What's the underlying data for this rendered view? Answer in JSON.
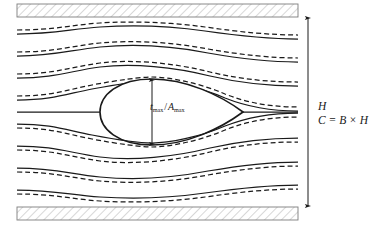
{
  "figure": {
    "kind": "flow-around-streamlined-body-in-channel",
    "background_color": "#ffffff",
    "line_color": "#1a1a1a",
    "wall_hatch_color": "#9a9a9a"
  },
  "labels": {
    "height_symbol": "H",
    "area_relation": "C = B × H",
    "thickness_ratio": {
      "numerator_symbol": "t",
      "numerator_subscript": "max",
      "separator": "/",
      "denominator_symbol": "A",
      "denominator_subscript": "max"
    }
  },
  "channel": {
    "left_x": 17,
    "right_x": 298,
    "top_wall_bottom_y": 17,
    "bottom_wall_top_y": 207,
    "wall_band_thickness": 13,
    "hatch_angle_deg": 45
  },
  "body": {
    "shape": "teardrop-airfoil",
    "leading_edge_x": 100,
    "trailing_edge_x": 243,
    "centerline_y": 112,
    "max_half_thickness": 33,
    "max_thickness_x": 152
  },
  "dimension_arrows": [
    {
      "name": "channel-height-arrow",
      "orientation": "vertical",
      "x": 308,
      "y_top": 17,
      "y_bottom": 207,
      "heads": "both"
    },
    {
      "name": "body-thickness-arrow",
      "orientation": "vertical",
      "x": 152,
      "y_top": 79,
      "y_bottom": 145,
      "heads": "both"
    }
  ],
  "streamlines": {
    "count_each_side": 4,
    "centerline_included": true,
    "solid_style": "solid",
    "dashed_style": "dashed",
    "dash_pattern": "5,3",
    "note": "Each solid streamline is paired with a dashed streamline displaced away from the centerline in the upper half and below it in the lower half"
  }
}
